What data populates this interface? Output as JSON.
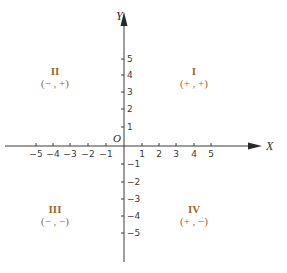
{
  "diagram": {
    "colors": {
      "axis": "#3a3a3a",
      "quadrant_label": "#9a6a2a"
    },
    "axes": {
      "x_label": "X",
      "y_label": "Y",
      "origin_label": "O",
      "x_ticks": [
        {
          "value": -5,
          "label": "−5"
        },
        {
          "value": -4,
          "label": "−4"
        },
        {
          "value": -3,
          "label": "−3"
        },
        {
          "value": -2,
          "label": "−2"
        },
        {
          "value": -1,
          "label": "−1"
        },
        {
          "value": 1,
          "label": "1"
        },
        {
          "value": 2,
          "label": "2"
        },
        {
          "value": 3,
          "label": "3"
        },
        {
          "value": 4,
          "label": "4"
        },
        {
          "value": 5,
          "label": "5"
        }
      ],
      "y_ticks": [
        {
          "value": 5,
          "label": "5"
        },
        {
          "value": 4,
          "label": "4"
        },
        {
          "value": 3,
          "label": "3"
        },
        {
          "value": 2,
          "label": "2"
        },
        {
          "value": 1,
          "label": "1"
        },
        {
          "value": -1,
          "label": "−1"
        },
        {
          "value": -2,
          "label": "−2"
        },
        {
          "value": -3,
          "label": "−3"
        },
        {
          "value": -4,
          "label": "−4"
        },
        {
          "value": -5,
          "label": "−5"
        }
      ]
    },
    "quadrants": [
      {
        "id": "I",
        "numeral": "I",
        "signs": "(+ , +)"
      },
      {
        "id": "II",
        "numeral": "II",
        "signs": "(− , +)"
      },
      {
        "id": "III",
        "numeral": "III",
        "signs": "(− , −)"
      },
      {
        "id": "IV",
        "numeral": "IV",
        "signs": "(+ , −)"
      }
    ]
  }
}
